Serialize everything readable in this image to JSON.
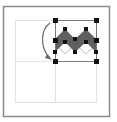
{
  "diagram": {
    "colors": {
      "frame": "#8a8a8a",
      "grid": "#e2e2e2",
      "shape_fill": "#5f5f5f",
      "ghost_stroke": "#d0d0d0",
      "handle": "#111111",
      "arrow": "#6a6a6a",
      "selection_box": "#7a7a7a"
    },
    "icons": [
      "curved-arrow-icon",
      "zigzag-shape",
      "selection-handles"
    ]
  }
}
